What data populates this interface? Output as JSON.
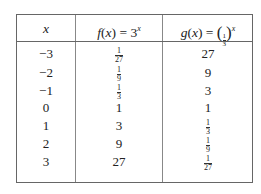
{
  "table": {
    "headers": {
      "x": "x",
      "f": {
        "name": "f",
        "arg": "x",
        "eq": " = 3",
        "exp": "x"
      },
      "g": {
        "name": "g",
        "arg": "x",
        "eq": " = ",
        "base_num": "1",
        "base_den": "3",
        "exp": "x"
      }
    },
    "rows": [
      {
        "x": "−3",
        "f": {
          "num": "1",
          "den": "27"
        },
        "g": "27"
      },
      {
        "x": "−2",
        "f": {
          "num": "1",
          "den": "9"
        },
        "g": "9"
      },
      {
        "x": "−1",
        "f": {
          "num": "1",
          "den": "3"
        },
        "g": "3"
      },
      {
        "x": "0",
        "f": "1",
        "g": "1"
      },
      {
        "x": "1",
        "f": "3",
        "g": {
          "num": "1",
          "den": "3"
        }
      },
      {
        "x": "2",
        "f": "9",
        "g": {
          "num": "1",
          "den": "9"
        }
      },
      {
        "x": "3",
        "f": "27",
        "g": {
          "num": "1",
          "den": "27"
        }
      }
    ]
  }
}
